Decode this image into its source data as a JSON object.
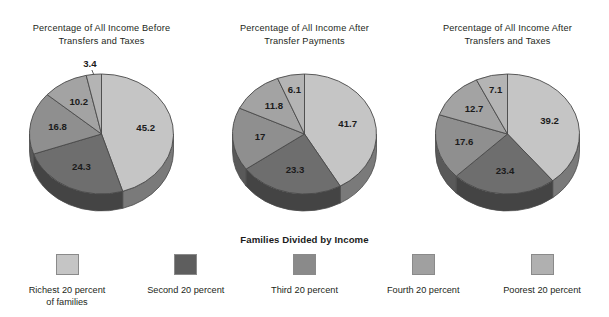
{
  "chart_data": [
    {
      "type": "pie",
      "title": "Percentage of All Income Before\nTransfers and Taxes",
      "categories": [
        "Richest 20 percent of families",
        "Second 20 percent",
        "Third 20 percent",
        "Fourth 20 percent",
        "Poorest 20 percent"
      ],
      "values": [
        45.2,
        24.3,
        16.8,
        10.2,
        3.4
      ],
      "labels": [
        "45.2",
        "24.3",
        "16.8",
        "10.2",
        "3.4"
      ],
      "label_positions": [
        "inside",
        "inside",
        "inside",
        "inside",
        "outside"
      ],
      "colors": [
        "#c5c5c5",
        "#6e6e6e",
        "#8f8f8f",
        "#a3a3a3",
        "#b4b4b4"
      ],
      "start_angle_deg": 0,
      "direction": "clockwise",
      "three_d": true,
      "legend_position": "bottom-shared"
    },
    {
      "type": "pie",
      "title": "Percentage of All Income After\nTransfer Payments",
      "categories": [
        "Richest 20 percent of families",
        "Second 20 percent",
        "Third 20 percent",
        "Fourth 20 percent",
        "Poorest 20 percent"
      ],
      "values": [
        41.7,
        23.3,
        17.0,
        11.8,
        6.1
      ],
      "labels": [
        "41.7",
        "23.3",
        "17",
        "11.8",
        "6.1"
      ],
      "label_positions": [
        "inside",
        "inside",
        "inside",
        "inside",
        "inside"
      ],
      "colors": [
        "#c5c5c5",
        "#6e6e6e",
        "#8f8f8f",
        "#a3a3a3",
        "#b4b4b4"
      ],
      "start_angle_deg": 0,
      "direction": "clockwise",
      "three_d": true,
      "legend_position": "bottom-shared"
    },
    {
      "type": "pie",
      "title": "Percentage of All Income After\nTransfers and Taxes",
      "categories": [
        "Richest 20 percent of families",
        "Second 20 percent",
        "Third 20 percent",
        "Fourth 20 percent",
        "Poorest 20 percent"
      ],
      "values": [
        39.2,
        23.4,
        17.6,
        12.7,
        7.1
      ],
      "labels": [
        "39.2",
        "23.4",
        "17.6",
        "12.7",
        "7.1"
      ],
      "label_positions": [
        "inside",
        "inside",
        "inside",
        "inside",
        "inside"
      ],
      "colors": [
        "#c5c5c5",
        "#6e6e6e",
        "#8f8f8f",
        "#a3a3a3",
        "#b4b4b4"
      ],
      "start_angle_deg": 0,
      "direction": "clockwise",
      "three_d": true,
      "legend_position": "bottom-shared"
    }
  ],
  "legend": {
    "title": "Families Divided by Income",
    "items": [
      {
        "label": "Richest 20 percent\nof families",
        "color": "#c5c5c5"
      },
      {
        "label": "Second 20 percent",
        "color": "#5e5e5e"
      },
      {
        "label": "Third 20 percent",
        "color": "#8a8a8a"
      },
      {
        "label": "Fourth 20 percent",
        "color": "#a0a0a0"
      },
      {
        "label": "Poorest 20 percent",
        "color": "#b0b0b0"
      }
    ]
  },
  "style": {
    "background": "#ffffff",
    "outline": "#4a4a4a",
    "text": "#231f20"
  }
}
